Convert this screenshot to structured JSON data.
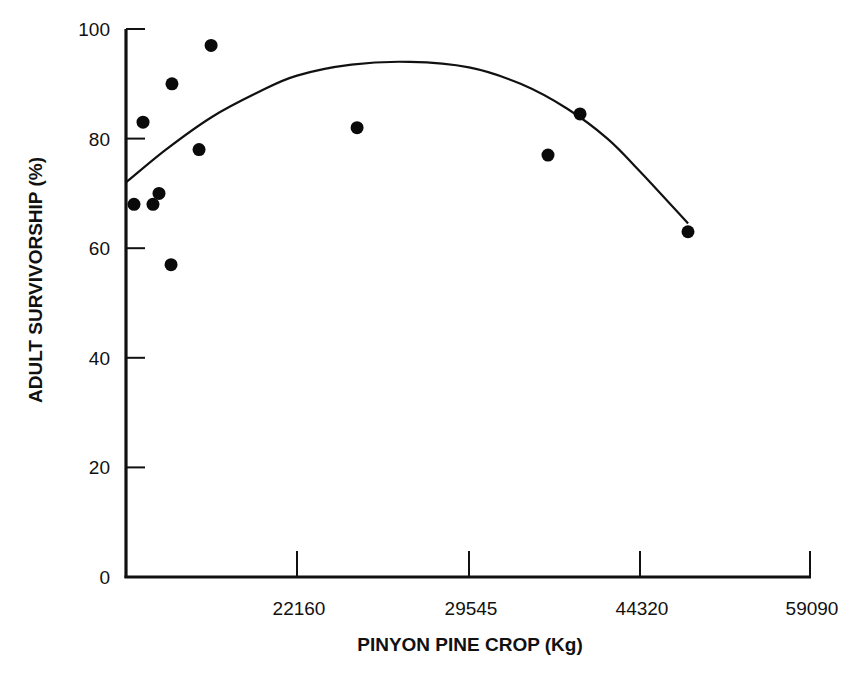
{
  "chart_data": {
    "type": "scatter",
    "title": "",
    "xlabel": "PINYON PINE CROP (Kg)",
    "ylabel": "ADULT SURVIVORSHIP (%)",
    "ylim": [
      0,
      100
    ],
    "y_ticks": [
      "0",
      "20",
      "40",
      "60",
      "80",
      "100"
    ],
    "x_ticks": [
      "22160",
      "29545",
      "44320",
      "59090"
    ],
    "x_tick_values": [
      22160,
      29545,
      44320,
      59090
    ],
    "x_origin_value": 14775,
    "grid": false,
    "legend": null,
    "series": [
      {
        "name": "observations",
        "kind": "scatter",
        "points": [
          {
            "x": 15120,
            "y": 68
          },
          {
            "x": 15510,
            "y": 83
          },
          {
            "x": 15940,
            "y": 68
          },
          {
            "x": 16200,
            "y": 70
          },
          {
            "x": 16720,
            "y": 57
          },
          {
            "x": 16760,
            "y": 90
          },
          {
            "x": 17930,
            "y": 78
          },
          {
            "x": 18450,
            "y": 97
          },
          {
            "x": 24740,
            "y": 82
          },
          {
            "x": 36370,
            "y": 77
          },
          {
            "x": 39140,
            "y": 84.5
          },
          {
            "x": 48490,
            "y": 63
          }
        ]
      },
      {
        "name": "fitted curve",
        "kind": "line",
        "points": [
          {
            "x": 14775,
            "y": 72
          },
          {
            "x": 16500,
            "y": 78
          },
          {
            "x": 18500,
            "y": 84
          },
          {
            "x": 20500,
            "y": 88.5
          },
          {
            "x": 22160,
            "y": 91.5
          },
          {
            "x": 24500,
            "y": 93.5
          },
          {
            "x": 27000,
            "y": 94
          },
          {
            "x": 29545,
            "y": 93
          },
          {
            "x": 34000,
            "y": 90
          },
          {
            "x": 38000,
            "y": 85.5
          },
          {
            "x": 41500,
            "y": 80
          },
          {
            "x": 44320,
            "y": 74
          },
          {
            "x": 48500,
            "y": 64.5
          }
        ]
      }
    ]
  }
}
